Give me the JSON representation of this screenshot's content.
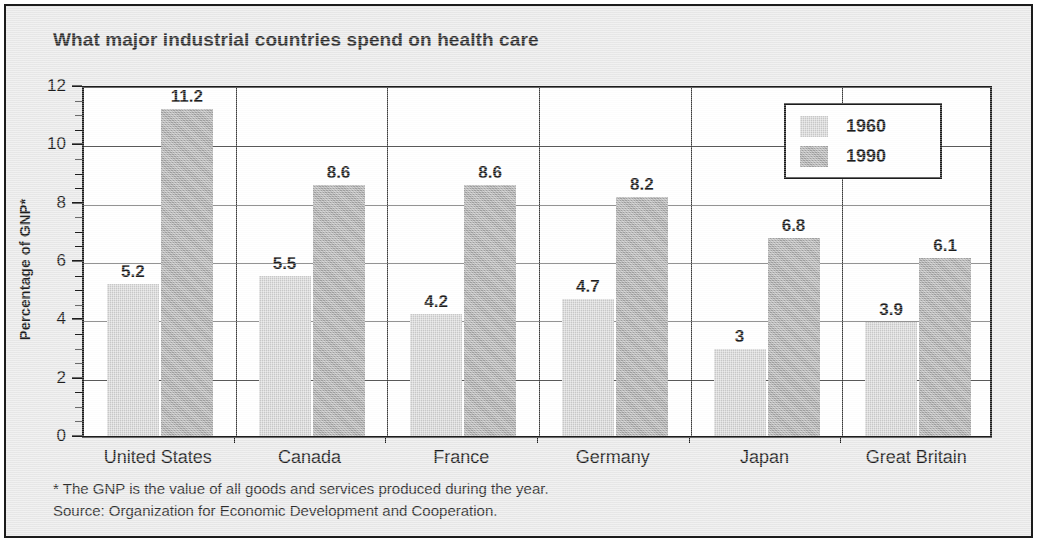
{
  "chart_data": {
    "type": "bar",
    "title": "What major industrial countries spend on health care",
    "xlabel": "",
    "ylabel": "Percentage of GNP*",
    "ylim": [
      0,
      12
    ],
    "ytick_step": 2,
    "yminor_step": 0.5,
    "ytick_labels": [
      "0",
      "2",
      "4",
      "6",
      "8",
      "10",
      "12"
    ],
    "grid": true,
    "legend_position": "top-right",
    "categories": [
      "United States",
      "Canada",
      "France",
      "Germany",
      "Japan",
      "Great Britain"
    ],
    "series": [
      {
        "name": "1960",
        "color": "#c9c9c9",
        "values": [
          5.2,
          5.5,
          4.2,
          4.7,
          3,
          3.9
        ],
        "labels": [
          "5.2",
          "5.5",
          "4.2",
          "4.7",
          "3",
          "3.9"
        ]
      },
      {
        "name": "1990",
        "color": "#a9a9a9",
        "values": [
          11.2,
          8.6,
          8.6,
          8.2,
          6.8,
          6.1
        ],
        "labels": [
          "11.2",
          "8.6",
          "8.6",
          "8.2",
          "6.8",
          "6.1"
        ]
      }
    ],
    "footnotes": [
      "* The GNP is the value of all goods and services produced during the year.",
      "Source: Organization for Economic Development and Cooperation."
    ]
  },
  "colors": {
    "frame": "#1c1c1c",
    "card_background": "#e9e9e9",
    "plot_background": "#ffffff",
    "series_1960": "#c9c9c9",
    "series_1990": "#a9a9a9"
  }
}
